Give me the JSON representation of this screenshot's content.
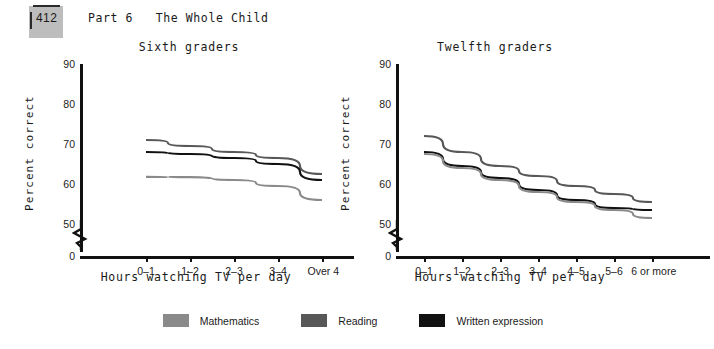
{
  "header": {
    "page_number": "412",
    "running_head": "Part 6   The Whole Child"
  },
  "legend": {
    "items": [
      {
        "label": "Mathematics",
        "color": "#8a8a8a",
        "icon": "color-swatch"
      },
      {
        "label": "Reading",
        "color": "#585858",
        "icon": "color-swatch"
      },
      {
        "label": "Written expression",
        "color": "#111111",
        "icon": "color-swatch"
      }
    ]
  },
  "chart_data": [
    {
      "type": "line",
      "title": "Sixth graders",
      "xlabel": "Hours watching TV per day",
      "ylabel": "Percent correct",
      "categories": [
        "0–1",
        "1–2",
        "2–3",
        "3–4",
        "Over 4"
      ],
      "ylim": [
        0,
        90
      ],
      "yticks": [
        0,
        50,
        60,
        70,
        80,
        90
      ],
      "axis_break": true,
      "grid": false,
      "legend_position": "bottom-shared",
      "series": [
        {
          "name": "Reading",
          "color": "#585858",
          "values": [
            71,
            69.5,
            68,
            66.5,
            62.5
          ]
        },
        {
          "name": "Written expression",
          "color": "#111111",
          "values": [
            68,
            67.5,
            66.5,
            65,
            61
          ]
        },
        {
          "name": "Mathematics",
          "color": "#8a8a8a",
          "values": [
            61.8,
            61.7,
            61,
            59.5,
            56
          ]
        }
      ]
    },
    {
      "type": "line",
      "title": "Twelfth graders",
      "xlabel": "Hours watching TV per day",
      "ylabel": "Percent correct",
      "categories": [
        "0–1",
        "1–2",
        "2–3",
        "3–4",
        "4–5",
        "5–6",
        "6 or more"
      ],
      "ylim": [
        0,
        90
      ],
      "yticks": [
        0,
        50,
        60,
        70,
        80,
        90
      ],
      "axis_break": true,
      "grid": false,
      "legend_position": "bottom-shared",
      "series": [
        {
          "name": "Reading",
          "color": "#585858",
          "values": [
            72,
            68,
            64.5,
            62,
            59.5,
            57.5,
            55.5
          ]
        },
        {
          "name": "Written expression",
          "color": "#111111",
          "values": [
            68,
            64.5,
            61.5,
            58.5,
            56,
            54,
            53.5
          ]
        },
        {
          "name": "Mathematics",
          "color": "#8a8a8a",
          "values": [
            67.5,
            64,
            61,
            58,
            55.5,
            53.5,
            51.5
          ]
        }
      ]
    }
  ]
}
